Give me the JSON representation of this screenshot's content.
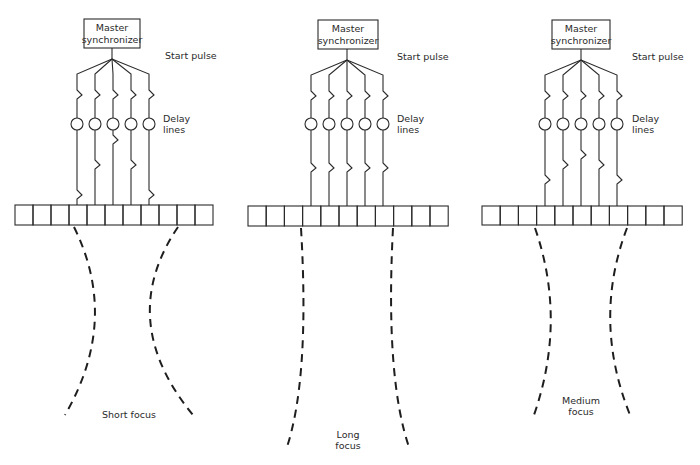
{
  "diagram": {
    "colors": {
      "ink": "#2a2a2a",
      "background": "#ffffff"
    },
    "panels": [
      {
        "id": "short",
        "box": {
          "x": 84,
          "y": 19,
          "w": 56,
          "h": 29,
          "line1": "Master",
          "line2": "synchronizer"
        },
        "hub": {
          "x": 112,
          "y": 59
        },
        "start_pulse_label": "Start pulse",
        "start_pulse_pos": {
          "x": 165,
          "y": 59
        },
        "delay_label": [
          "Delay",
          "lines"
        ],
        "delay_label_pos": {
          "x": 163,
          "y": 122
        },
        "channels_x": [
          77,
          95,
          113,
          131,
          149
        ],
        "channel_top_y": 74,
        "upper_zigzag_y": 95,
        "circle_y": 124,
        "lower_zigzag_y": [
          195,
          165,
          140,
          165,
          195
        ],
        "array": {
          "x": 15,
          "y": 205,
          "cell_w": 18,
          "h": 20,
          "cells": 11
        },
        "beam_left": "M 74 227 Q 120 320 65 415",
        "beam_right": "M 178 227 Q 115 320 193 415",
        "focus_label": [
          "Short focus"
        ],
        "focus_label_pos": {
          "x": 129,
          "y": 418
        }
      },
      {
        "id": "long",
        "box": {
          "x": 318,
          "y": 20,
          "w": 60,
          "h": 29,
          "line1": "Master",
          "line2": "synchronizer"
        },
        "hub": {
          "x": 347,
          "y": 60
        },
        "start_pulse_label": "Start pulse",
        "start_pulse_pos": {
          "x": 397,
          "y": 60
        },
        "delay_label": [
          "Delay",
          "lines"
        ],
        "delay_label_pos": {
          "x": 397,
          "y": 122
        },
        "channels_x": [
          311,
          329,
          347,
          365,
          383
        ],
        "channel_top_y": 75,
        "upper_zigzag_y": 96,
        "circle_y": 124,
        "lower_zigzag_y": [
          168,
          168,
          168,
          168,
          168
        ],
        "array": {
          "x": 248,
          "y": 206,
          "cell_w": 18.2,
          "h": 20,
          "cells": 11
        },
        "beam_left": "M 301 228 Q 310 380 286 450",
        "beam_right": "M 393 228 Q 385 380 410 450",
        "focus_label": [
          "Long",
          "focus"
        ],
        "focus_label_pos": {
          "x": 348,
          "y": 438
        }
      },
      {
        "id": "medium",
        "box": {
          "x": 552,
          "y": 20,
          "w": 58,
          "h": 29,
          "line1": "Master",
          "line2": "synchronizer"
        },
        "hub": {
          "x": 581,
          "y": 60
        },
        "start_pulse_label": "Start pulse",
        "start_pulse_pos": {
          "x": 632,
          "y": 60
        },
        "delay_label": [
          "Delay",
          "lines"
        ],
        "delay_label_pos": {
          "x": 632,
          "y": 122
        },
        "channels_x": [
          545,
          563,
          581,
          599,
          617
        ],
        "channel_top_y": 75,
        "upper_zigzag_y": 96,
        "circle_y": 124,
        "lower_zigzag_y": [
          180,
          165,
          155,
          165,
          180
        ],
        "array": {
          "x": 482,
          "y": 206,
          "cell_w": 18.2,
          "h": 19,
          "cells": 11
        },
        "beam_left": "M 535 228 Q 567 320 534 415",
        "beam_right": "M 627 228 Q 592 320 630 415",
        "focus_label": [
          "Medium",
          "focus"
        ],
        "focus_label_pos": {
          "x": 581,
          "y": 404
        }
      }
    ]
  }
}
